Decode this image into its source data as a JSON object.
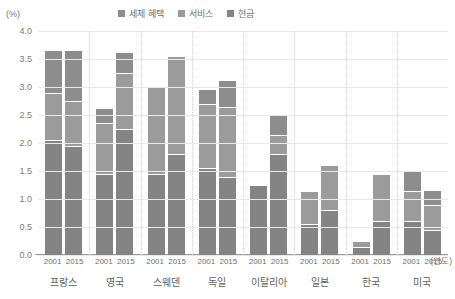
{
  "chart_data": {
    "type": "bar",
    "subtype": "stacked-grouped-column",
    "title": "",
    "xlabel": "(연도)",
    "ylabel": "(%)",
    "ylim": [
      0.0,
      4.0
    ],
    "ytick_step": 0.5,
    "ytick_labels": [
      "4.0",
      "3.5",
      "3.0",
      "2.5",
      "2.0",
      "1.5",
      "1.0",
      "0.5",
      "0.0"
    ],
    "grid": true,
    "legend_position": "top-center",
    "legend": [
      "세제 혜택",
      "서비스",
      "현금"
    ],
    "categories": [
      "프랑스",
      "영국",
      "스웨덴",
      "독일",
      "이탈리아",
      "일본",
      "한국",
      "미국"
    ],
    "subcategories": [
      "2001",
      "2015"
    ],
    "series": [
      {
        "name": "현금",
        "values": [
          [
            2.05,
            1.95
          ],
          [
            1.45,
            2.25
          ],
          [
            1.45,
            1.8
          ],
          [
            1.55,
            1.4
          ],
          [
            1.25,
            1.8
          ],
          [
            0.55,
            0.8
          ],
          [
            0.15,
            0.6
          ],
          [
            0.6,
            0.45
          ]
        ]
      },
      {
        "name": "서비스",
        "values": [
          [
            0.85,
            0.8
          ],
          [
            0.9,
            1.0
          ],
          [
            1.55,
            1.75
          ],
          [
            1.15,
            1.25
          ],
          [
            0.0,
            0.35
          ],
          [
            0.6,
            0.8
          ],
          [
            0.1,
            0.85
          ],
          [
            0.55,
            0.45
          ]
        ]
      },
      {
        "name": "세제 혜택",
        "values": [
          [
            0.75,
            0.9
          ],
          [
            0.25,
            0.35
          ],
          [
            0.0,
            0.0
          ],
          [
            0.25,
            0.45
          ],
          [
            0.0,
            0.35
          ],
          [
            0.0,
            0.0
          ],
          [
            0.0,
            0.0
          ],
          [
            0.35,
            0.25
          ]
        ]
      }
    ],
    "totals": [
      [
        3.65,
        3.65
      ],
      [
        2.6,
        3.6
      ],
      [
        3.0,
        3.55
      ],
      [
        2.95,
        3.1
      ],
      [
        1.25,
        2.5
      ],
      [
        1.15,
        1.6
      ],
      [
        0.25,
        1.45
      ],
      [
        1.5,
        1.15
      ]
    ],
    "colors": {
      "tax": "#8d8d8d",
      "service": "#9b9b9b",
      "cash": "#848484",
      "grid": "#e9e9e9",
      "axis": "#9a9a9a",
      "separator": "#d2d2d2",
      "text": "#6e6e6e"
    }
  }
}
